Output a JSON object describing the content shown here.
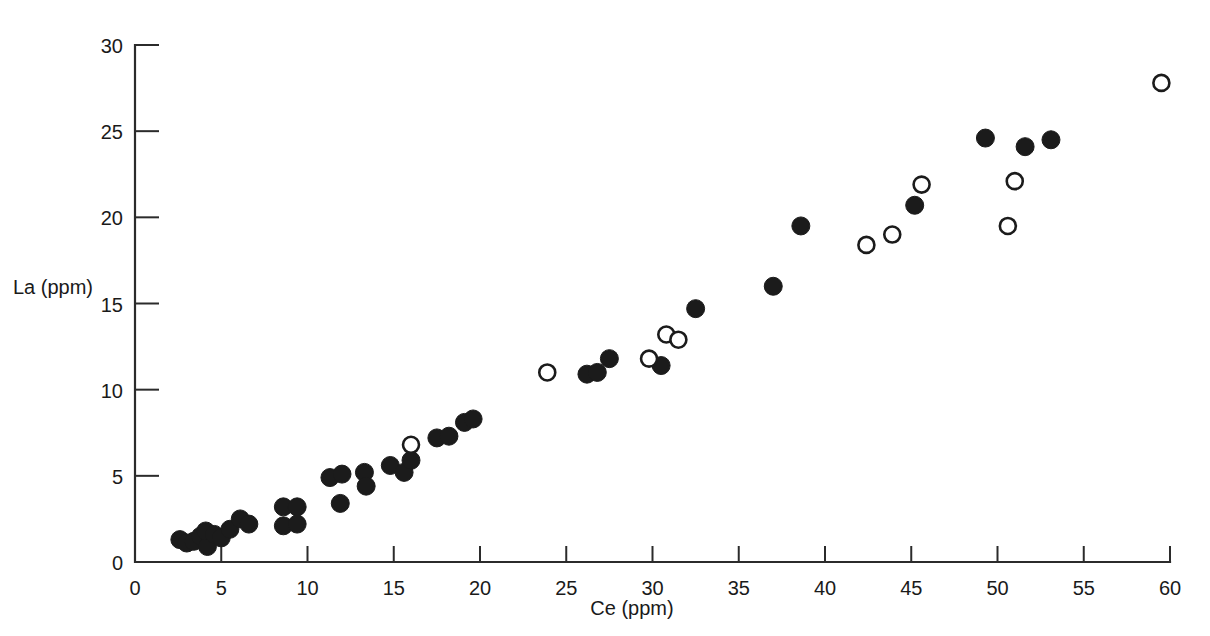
{
  "figure": {
    "background_color": "#ffffff",
    "marker_color": "#1b1b1b",
    "open_marker_fill": "#ffffff"
  },
  "axes": {
    "x_label": "Ce (ppm)",
    "y_label": "La (ppm)",
    "x_ticks": [
      "0",
      "5",
      "10",
      "15",
      "20",
      "25",
      "30",
      "35",
      "40",
      "45",
      "50",
      "55",
      "60"
    ],
    "y_ticks": [
      "0",
      "5",
      "10",
      "15",
      "20",
      "25",
      "30"
    ]
  },
  "chart_data": {
    "type": "scatter",
    "title": "",
    "xlabel": "Ce (ppm)",
    "ylabel": "La (ppm)",
    "xlim": [
      0,
      60
    ],
    "ylim": [
      0,
      30
    ],
    "xticks": [
      0,
      5,
      10,
      15,
      20,
      25,
      30,
      35,
      40,
      45,
      50,
      55,
      60
    ],
    "yticks": [
      0,
      5,
      10,
      15,
      20,
      25,
      30
    ],
    "grid": false,
    "legend": null,
    "series": [
      {
        "name": "filled-circles",
        "marker": "filled-circle",
        "color": "#1b1b1b",
        "points": [
          [
            2.6,
            1.3
          ],
          [
            3.0,
            1.1
          ],
          [
            3.4,
            1.2
          ],
          [
            3.8,
            1.5
          ],
          [
            4.2,
            0.9
          ],
          [
            4.1,
            1.8
          ],
          [
            4.6,
            1.6
          ],
          [
            5.0,
            1.4
          ],
          [
            5.5,
            1.9
          ],
          [
            6.1,
            2.5
          ],
          [
            6.6,
            2.2
          ],
          [
            8.6,
            3.2
          ],
          [
            9.4,
            3.2
          ],
          [
            8.6,
            2.1
          ],
          [
            9.4,
            2.2
          ],
          [
            11.3,
            4.9
          ],
          [
            11.9,
            3.4
          ],
          [
            12.0,
            5.1
          ],
          [
            13.3,
            5.2
          ],
          [
            13.4,
            4.4
          ],
          [
            14.8,
            5.6
          ],
          [
            15.6,
            5.2
          ],
          [
            16.0,
            5.9
          ],
          [
            17.5,
            7.2
          ],
          [
            18.2,
            7.3
          ],
          [
            19.1,
            8.1
          ],
          [
            19.6,
            8.3
          ],
          [
            26.2,
            10.9
          ],
          [
            26.8,
            11.0
          ],
          [
            27.5,
            11.8
          ],
          [
            30.5,
            11.4
          ],
          [
            32.5,
            14.7
          ],
          [
            37.0,
            16.0
          ],
          [
            38.6,
            19.5
          ],
          [
            45.2,
            20.7
          ],
          [
            49.3,
            24.6
          ],
          [
            51.6,
            24.1
          ],
          [
            53.1,
            24.5
          ]
        ]
      },
      {
        "name": "open-circles",
        "marker": "open-circle",
        "color": "#1b1b1b",
        "points": [
          [
            16.0,
            6.8
          ],
          [
            23.9,
            11.0
          ],
          [
            29.8,
            11.8
          ],
          [
            30.8,
            13.2
          ],
          [
            31.5,
            12.9
          ],
          [
            42.4,
            18.4
          ],
          [
            43.9,
            19.0
          ],
          [
            45.6,
            21.9
          ],
          [
            50.6,
            19.5
          ],
          [
            51.0,
            22.1
          ],
          [
            59.5,
            27.8
          ]
        ]
      }
    ]
  }
}
